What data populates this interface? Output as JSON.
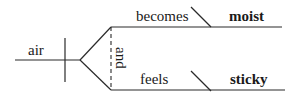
{
  "diagram": {
    "type": "sentence-diagram",
    "subject": "air",
    "conjunction": "and",
    "predicates": [
      {
        "verb": "becomes",
        "complement": "moist",
        "complement_bold": true
      },
      {
        "verb": "feels",
        "complement": "sticky",
        "complement_bold": true
      }
    ],
    "colors": {
      "line": "#2a2a2a",
      "text": "#1a1a1a",
      "background": "#ffffff"
    }
  }
}
